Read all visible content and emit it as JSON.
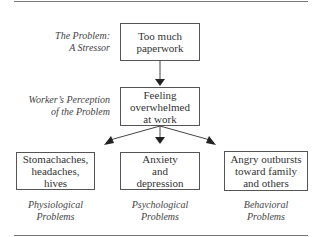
{
  "diagram": {
    "stressor_label": [
      "The Problem:",
      "A Stressor"
    ],
    "stressor_box": "Too much paperwork",
    "perception_label": [
      "Worker’s Perception",
      "of the Problem"
    ],
    "perception_box": "Feeling overwhelmed at work",
    "outcomes": [
      {
        "box": "Stomachaches, headaches, hives",
        "label": [
          "Physiological",
          "Problems"
        ]
      },
      {
        "box": "Anxiety and depression",
        "label": [
          "Psychological",
          "Problems"
        ]
      },
      {
        "box": "Angry outbursts toward family and others",
        "label": [
          "Behavioral",
          "Problems"
        ]
      }
    ]
  }
}
